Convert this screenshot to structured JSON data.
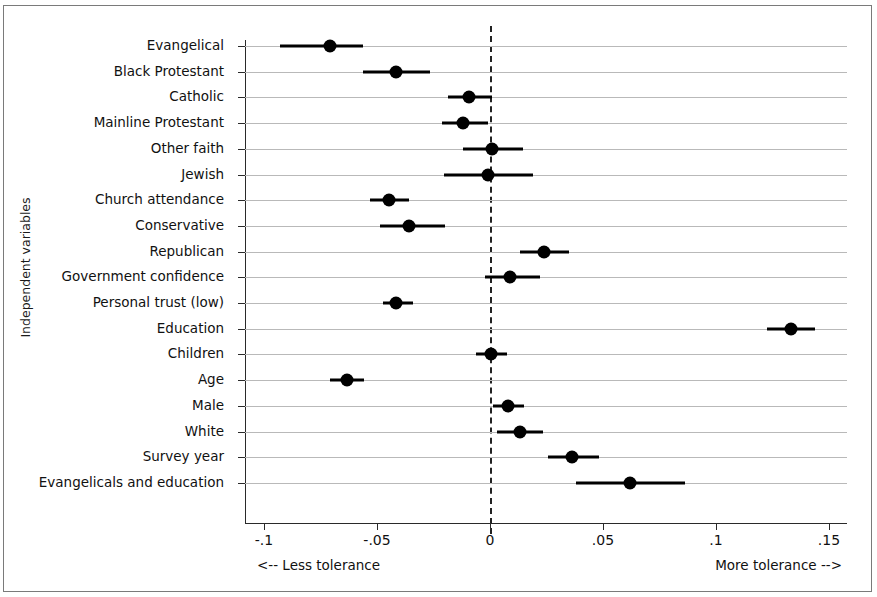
{
  "figure": {
    "ylabel": "Independent variables",
    "left_annotation": "<-- Less tolerance",
    "right_annotation": "More tolerance -->"
  },
  "chart_data": {
    "type": "scatter",
    "plot_style": "coefficient-plot-with-confidence-intervals",
    "title": "",
    "xlabel": "",
    "ylabel": "Independent variables",
    "xlim": [
      -0.1083,
      0.158
    ],
    "xticks": [
      -0.1,
      -0.05,
      0,
      0.05,
      0.1,
      0.15
    ],
    "xticklabels": [
      "-.1",
      "-.05",
      "0",
      ".05",
      ".1",
      ".15"
    ],
    "grid": true,
    "grid_axis": "y",
    "legend": null,
    "reference_line": {
      "value": 0,
      "style": "dashed"
    },
    "annotations": [
      {
        "text": "<-- Less tolerance",
        "position": "below-axis-left"
      },
      {
        "text": "More tolerance -->",
        "position": "below-axis-right"
      }
    ],
    "categories": [
      "Evangelical",
      "Black Protestant",
      "Catholic",
      "Mainline Protestant",
      "Other faith",
      "Jewish",
      "Church attendance",
      "Conservative",
      "Republican",
      "Government confidence",
      "Personal trust (low)",
      "Education",
      "Children",
      "Age",
      "Male",
      "White",
      "Survey year",
      "Evangelicals and education"
    ],
    "points": [
      {
        "label": "Evangelical",
        "estimate": -0.0708,
        "ci_low": -0.0929,
        "ci_high": -0.0562
      },
      {
        "label": "Black Protestant",
        "estimate": -0.0416,
        "ci_low": -0.0562,
        "ci_high": -0.0265
      },
      {
        "label": "Catholic",
        "estimate": -0.0093,
        "ci_low": -0.0186,
        "ci_high": 0.0009
      },
      {
        "label": "Mainline Protestant",
        "estimate": -0.012,
        "ci_low": -0.0212,
        "ci_high": -0.0009
      },
      {
        "label": "Other faith",
        "estimate": 0.0009,
        "ci_low": -0.012,
        "ci_high": 0.0146
      },
      {
        "label": "Jewish",
        "estimate": -0.0009,
        "ci_low": -0.0204,
        "ci_high": 0.019
      },
      {
        "label": "Church attendance",
        "estimate": -0.0447,
        "ci_low": -0.0531,
        "ci_high": -0.0358
      },
      {
        "label": "Conservative",
        "estimate": -0.0358,
        "ci_low": -0.0487,
        "ci_high": -0.0199
      },
      {
        "label": "Republican",
        "estimate": 0.0239,
        "ci_low": 0.0133,
        "ci_high": 0.035
      },
      {
        "label": "Government confidence",
        "estimate": 0.0089,
        "ci_low": -0.0022,
        "ci_high": 0.0221
      },
      {
        "label": "Personal trust (low)",
        "estimate": -0.0416,
        "ci_low": -0.0473,
        "ci_high": -0.0341
      },
      {
        "label": "Education",
        "estimate": 0.1332,
        "ci_low": 0.1226,
        "ci_high": 0.1438
      },
      {
        "label": "Children",
        "estimate": 0.0004,
        "ci_low": -0.0062,
        "ci_high": 0.0075
      },
      {
        "label": "Age",
        "estimate": -0.0633,
        "ci_low": -0.0708,
        "ci_high": -0.0558
      },
      {
        "label": "Male",
        "estimate": 0.008,
        "ci_low": 0.0013,
        "ci_high": 0.015
      },
      {
        "label": "White",
        "estimate": 0.0133,
        "ci_low": 0.0031,
        "ci_high": 0.0235
      },
      {
        "label": "Survey year",
        "estimate": 0.0363,
        "ci_low": 0.0257,
        "ci_high": 0.0482
      },
      {
        "label": "Evangelicals and education",
        "estimate": 0.0619,
        "ci_low": 0.0381,
        "ci_high": 0.0862
      }
    ]
  },
  "geometry": {
    "x_zero_px": 490,
    "px_per_unit": 2260,
    "row_top_px": 46,
    "row_step_px": 25.7
  }
}
